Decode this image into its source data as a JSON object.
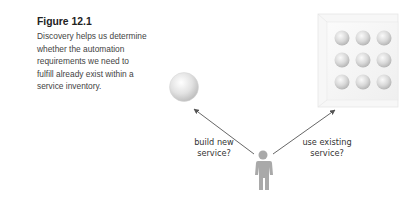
{
  "caption": {
    "title": "Figure 12.1",
    "text": "Discovery helps us determine whether the automation requirements we need to fulfill already exist within a service inventory."
  },
  "diagram": {
    "left_label_line1": "build new",
    "left_label_line2": "service?",
    "right_label_line1": "use existing",
    "right_label_line2": "service?",
    "new_service": "single-service-sphere",
    "inventory": "service-inventory-3x3-grid",
    "actor": "person-figure"
  }
}
